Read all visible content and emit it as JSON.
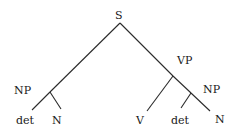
{
  "tree": {
    "root": "S",
    "nodes": {
      "S": {
        "label": "S"
      },
      "NP1": {
        "label": "NP"
      },
      "det1": {
        "label": "det"
      },
      "N1": {
        "label": "N"
      },
      "VP": {
        "label": "VP"
      },
      "V": {
        "label": "V"
      },
      "NP2": {
        "label": "NP"
      },
      "det2": {
        "label": "det"
      },
      "N2": {
        "label": "N"
      }
    },
    "edges": [
      [
        "S",
        "NP1"
      ],
      [
        "NP1",
        "det1"
      ],
      [
        "NP1",
        "N1"
      ],
      [
        "S",
        "VP"
      ],
      [
        "VP",
        "V"
      ],
      [
        "VP",
        "NP2"
      ],
      [
        "NP2",
        "det2"
      ],
      [
        "NP2",
        "N2"
      ]
    ]
  }
}
